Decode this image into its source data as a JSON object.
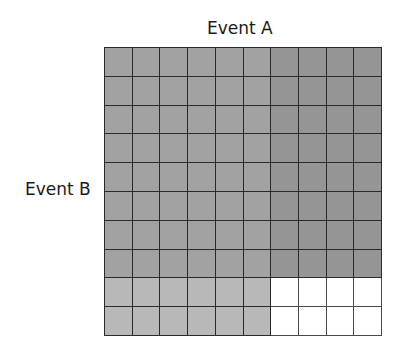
{
  "diagram": {
    "type": "probability-grid",
    "labels": {
      "top": "Event A",
      "left": "Event B"
    },
    "grid": {
      "rows": 10,
      "cols": 10,
      "regions": [
        {
          "name": "A-and-B",
          "rows": [
            1,
            8
          ],
          "cols": [
            1,
            6
          ],
          "color": "#a2a2a2"
        },
        {
          "name": "B-only",
          "rows": [
            1,
            8
          ],
          "cols": [
            7,
            10
          ],
          "color": "#959595"
        },
        {
          "name": "A-only",
          "rows": [
            9,
            10
          ],
          "cols": [
            1,
            6
          ],
          "color": "#b8b8b8"
        },
        {
          "name": "neither",
          "rows": [
            9,
            10
          ],
          "cols": [
            7,
            10
          ],
          "color": "#ffffff"
        }
      ]
    }
  }
}
